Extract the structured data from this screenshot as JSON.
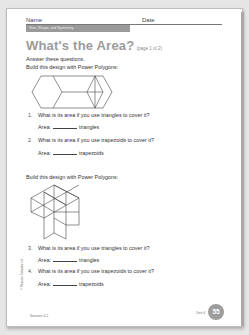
{
  "header": {
    "name_label": "Name",
    "date_label": "Date",
    "unit_band": "Size, Shape, and Symmetry"
  },
  "title": {
    "main": "What's the Area?",
    "sub": "(page 1 of 2)"
  },
  "intro": {
    "line1": "Answer these questions.",
    "line2": "Build this design with Power Polygons:"
  },
  "section1": {
    "figure": "hexagon-rhombus-design",
    "questions": [
      {
        "num": "1.",
        "text": "What is its area if you use triangles to cover it?",
        "answer_label": "Area:",
        "unit": "triangles"
      },
      {
        "num": "2.",
        "text": "What is its area if you use trapezoids to cover it?",
        "answer_label": "Area:",
        "unit": "trapezoids"
      }
    ]
  },
  "section2": {
    "intro": "Build this design with Power Polygons:",
    "figure": "isometric-rhombus-design",
    "questions": [
      {
        "num": "3.",
        "text": "What is its area if you use triangles to cover it?",
        "answer_label": "Area:",
        "unit": "triangles"
      },
      {
        "num": "4.",
        "text": "What is its area if you use trapezoids to cover it?",
        "answer_label": "Area:",
        "unit": "trapezoids"
      }
    ]
  },
  "footer": {
    "session": "Session 4.2",
    "unit": "Unit 4",
    "page_number": "55",
    "side_credit": "© Pearson Education 4"
  }
}
